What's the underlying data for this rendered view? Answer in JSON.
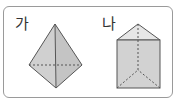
{
  "figures": [
    {
      "label": "가",
      "shape": "triangular-bipyramid"
    },
    {
      "label": "나",
      "shape": "triangular-prism"
    }
  ],
  "colors": {
    "fill": "#d4d4d4",
    "fill_top": "#e6e6e6",
    "stroke": "#555555",
    "border": "#9a9a9a"
  }
}
